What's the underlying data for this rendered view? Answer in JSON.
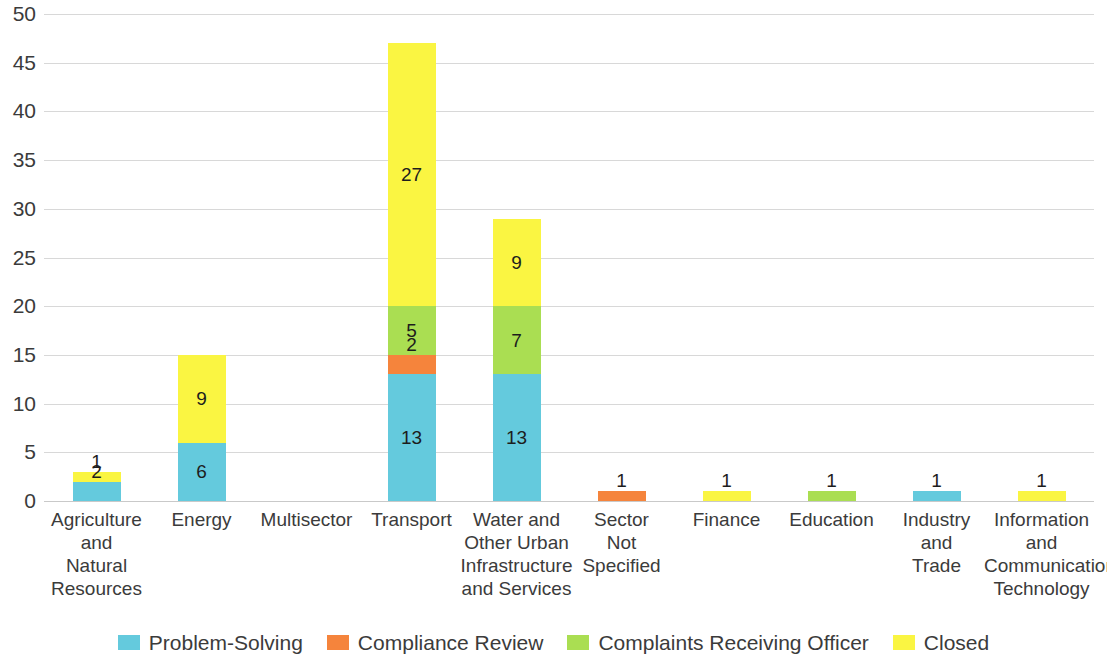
{
  "chart_data": {
    "type": "bar",
    "stacked": true,
    "title": "",
    "subtitle": "",
    "xlabel": "",
    "ylabel": "",
    "ylim": [
      0,
      50
    ],
    "yticks": [
      0,
      5,
      10,
      15,
      20,
      25,
      30,
      35,
      40,
      45,
      50
    ],
    "grid": true,
    "legend_position": "bottom",
    "categories": [
      "Agriculture and Natural Resources",
      "Energy",
      "Multisector",
      "Transport",
      "Water and Other Urban Infrastructure and Services",
      "Sector Not Specified",
      "Finance",
      "Education",
      "Industry and Trade",
      "Information and Communication Technology"
    ],
    "category_label_lines": [
      [
        "Agriculture",
        "and",
        "Natural",
        "Resources"
      ],
      [
        "Energy"
      ],
      [
        "Multisector"
      ],
      [
        "Transport"
      ],
      [
        "Water and",
        "Other Urban",
        "Infrastructure",
        "and Services"
      ],
      [
        "Sector",
        "Not",
        "Specified"
      ],
      [
        "Finance"
      ],
      [
        "Education"
      ],
      [
        "Industry",
        "and",
        "Trade"
      ],
      [
        "Information",
        "and",
        "Communication",
        "Technology"
      ]
    ],
    "series": [
      {
        "name": "Problem-Solving",
        "color": "#64CADD",
        "values": [
          2,
          6,
          0,
          13,
          13,
          0,
          0,
          0,
          1,
          0
        ]
      },
      {
        "name": "Compliance Review",
        "color": "#F5843C",
        "values": [
          0,
          0,
          0,
          2,
          0,
          1,
          0,
          0,
          0,
          0
        ]
      },
      {
        "name": "Complaints Receiving Officer",
        "color": "#AADE52",
        "values": [
          0,
          0,
          0,
          5,
          7,
          0,
          0,
          1,
          0,
          0
        ]
      },
      {
        "name": "Closed",
        "color": "#FAF542",
        "values": [
          1,
          9,
          0,
          27,
          9,
          0,
          1,
          0,
          0,
          1
        ]
      }
    ],
    "totals": [
      3,
      15,
      0,
      47,
      29,
      1,
      1,
      1,
      1,
      1
    ]
  },
  "axis": {
    "ytick_labels": [
      "0",
      "5",
      "10",
      "15",
      "20",
      "25",
      "30",
      "35",
      "40",
      "45",
      "50"
    ]
  },
  "legend": {
    "items": [
      {
        "label": "Problem-Solving",
        "color": "#64CADD"
      },
      {
        "label": "Compliance Review",
        "color": "#F5843C"
      },
      {
        "label": "Complaints Receiving Officer",
        "color": "#AADE52"
      },
      {
        "label": "Closed",
        "color": "#FAF542"
      }
    ]
  },
  "colors": {
    "gridline": "#d8d8d8",
    "text": "#3b3b3b",
    "background": "#ffffff"
  }
}
